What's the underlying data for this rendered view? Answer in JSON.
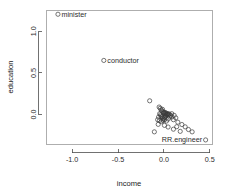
{
  "chart_data": {
    "type": "scatter",
    "title": "",
    "xlabel": "income",
    "ylabel": "education",
    "xlim": [
      -1.28,
      0.53
    ],
    "ylim": [
      -0.36,
      1.25
    ],
    "xticks": [
      -1.0,
      -0.5,
      0.0,
      0.5
    ],
    "xticklabels": [
      "-1.0",
      "-0.5",
      "0.0",
      "0.5"
    ],
    "yticks": [
      0.0,
      0.5,
      1.0
    ],
    "yticklabels": [
      "0.0",
      "0.5",
      "1.0"
    ],
    "grid": false,
    "legend": "none",
    "marker": "open-circle",
    "annotations": [
      {
        "label": "minister",
        "x": -1.155,
        "y": 1.205,
        "label_side": "right"
      },
      {
        "label": "conductor",
        "x": -0.655,
        "y": 0.65,
        "label_side": "right"
      },
      {
        "label": "RR.engineer",
        "x": 0.455,
        "y": -0.305,
        "label_side": "left"
      }
    ],
    "points": [
      {
        "x": -1.155,
        "y": 1.205
      },
      {
        "x": -0.655,
        "y": 0.65
      },
      {
        "x": 0.455,
        "y": -0.305
      },
      {
        "x": -0.155,
        "y": 0.165
      },
      {
        "x": -0.052,
        "y": 0.09
      },
      {
        "x": -0.04,
        "y": 0.075
      },
      {
        "x": -0.03,
        "y": 0.055
      },
      {
        "x": -0.022,
        "y": 0.042
      },
      {
        "x": -0.015,
        "y": 0.062
      },
      {
        "x": -0.008,
        "y": 0.03
      },
      {
        "x": -0.002,
        "y": 0.018
      },
      {
        "x": 0.004,
        "y": 0.028
      },
      {
        "x": 0.01,
        "y": 0.012
      },
      {
        "x": 0.016,
        "y": 0.022
      },
      {
        "x": 0.022,
        "y": 0.006
      },
      {
        "x": 0.028,
        "y": 0.016
      },
      {
        "x": 0.034,
        "y": 0.0
      },
      {
        "x": 0.04,
        "y": 0.01
      },
      {
        "x": 0.046,
        "y": -0.006
      },
      {
        "x": 0.052,
        "y": 0.004
      },
      {
        "x": -0.046,
        "y": 0.01
      },
      {
        "x": -0.038,
        "y": -0.004
      },
      {
        "x": -0.03,
        "y": -0.018
      },
      {
        "x": -0.022,
        "y": -0.03
      },
      {
        "x": -0.014,
        "y": -0.044
      },
      {
        "x": -0.006,
        "y": -0.056
      },
      {
        "x": 0.002,
        "y": -0.042
      },
      {
        "x": 0.01,
        "y": -0.03
      },
      {
        "x": 0.018,
        "y": -0.018
      },
      {
        "x": 0.026,
        "y": -0.006
      },
      {
        "x": -0.058,
        "y": -0.03
      },
      {
        "x": -0.068,
        "y": -0.062
      },
      {
        "x": -0.048,
        "y": -0.072
      },
      {
        "x": -0.028,
        "y": -0.086
      },
      {
        "x": -0.01,
        "y": -0.072
      },
      {
        "x": 0.008,
        "y": -0.062
      },
      {
        "x": 0.028,
        "y": -0.078
      },
      {
        "x": 0.048,
        "y": -0.054
      },
      {
        "x": 0.062,
        "y": -0.03
      },
      {
        "x": 0.074,
        "y": -0.012
      },
      {
        "x": 0.088,
        "y": -0.03
      },
      {
        "x": 0.104,
        "y": -0.062
      },
      {
        "x": 0.06,
        "y": 0.006
      },
      {
        "x": 0.086,
        "y": 0.01
      },
      {
        "x": 0.112,
        "y": -0.01
      },
      {
        "x": 0.13,
        "y": -0.04
      },
      {
        "x": 0.152,
        "y": -0.092
      },
      {
        "x": 0.196,
        "y": -0.12
      },
      {
        "x": 0.232,
        "y": -0.148
      },
      {
        "x": 0.268,
        "y": -0.18
      },
      {
        "x": 0.308,
        "y": -0.208
      },
      {
        "x": -0.104,
        "y": -0.208
      },
      {
        "x": -0.062,
        "y": -0.118
      },
      {
        "x": 0.006,
        "y": -0.13
      },
      {
        "x": 0.046,
        "y": -0.15
      },
      {
        "x": 0.104,
        "y": -0.176
      },
      {
        "x": 0.14,
        "y": -0.146
      },
      {
        "x": 0.178,
        "y": -0.202
      }
    ]
  }
}
